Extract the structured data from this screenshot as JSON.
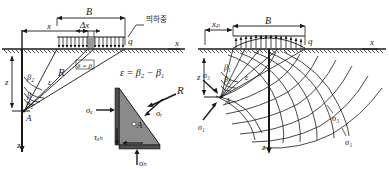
{
  "figure": {
    "title": "",
    "domain": "geotechnical-stress-diagram",
    "panels": [
      {
        "id": "left",
        "name": "strip-load-uniform",
        "load_label": "q",
        "load_annotation": "띄하중",
        "width_label": "B",
        "offset_label": "x",
        "element_width_label": "Δx",
        "axis_x": "x",
        "axis_z": "z",
        "depth_label": "z",
        "point_label": "A",
        "radius_label": "R",
        "angles": [
          "β₂",
          "β",
          "β₁"
        ],
        "epsilon_label": "ε",
        "delta_label": "δ = β",
        "equation": "ε = β₂ − β₁"
      },
      {
        "id": "left-element",
        "name": "stress-element",
        "point_label": "A",
        "stresses": [
          {
            "name": "sigma-x",
            "label": "σₓ"
          },
          {
            "name": "sigma-z",
            "label": "σₕ"
          },
          {
            "name": "sigma-r",
            "label": "σᵣ"
          },
          {
            "name": "tau-xz",
            "label": "τₓₕ"
          },
          {
            "name": "resultant-R",
            "label": "R"
          }
        ]
      },
      {
        "id": "right",
        "name": "principal-stress-trajectories",
        "load_label": "q",
        "width_label": "B",
        "offset_label": "xₚ",
        "axis_x": "x",
        "axis_z": "z",
        "depth_label": "z",
        "point_label": "A",
        "angles": [
          "β₁",
          "β₂"
        ],
        "epsilon_label": "ε",
        "stresses": [
          {
            "name": "sigma-1-at-A",
            "label": "σ₁"
          },
          {
            "name": "sigma-3-at-A",
            "label": "σ₃"
          },
          {
            "name": "sigma-1-trajectory",
            "label": "σ₁"
          },
          {
            "name": "sigma-3-trajectory",
            "label": "σ₃"
          }
        ]
      }
    ],
    "colors": {
      "line": "#1a1a1a",
      "ground": "#333333",
      "element_fill": "#8a8a8a",
      "background": "#ffffff"
    }
  }
}
